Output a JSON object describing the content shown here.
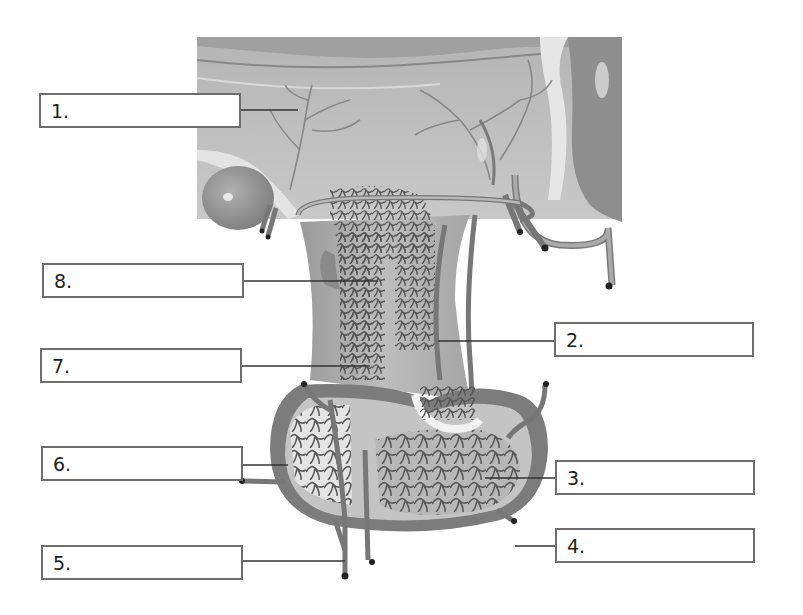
{
  "diagram": {
    "colors": {
      "background": "#ffffff",
      "tissue_light": "#c9c9c9",
      "tissue_mid": "#a9a9a9",
      "tissue_dark": "#7d7d7d",
      "vessel": "#8a8a8a",
      "vessel_outline": "#4a4a4a",
      "label_border": "#6e6e6e",
      "leader_line": "#333333"
    },
    "labels": [
      {
        "id": 1,
        "text": "1.",
        "side": "left"
      },
      {
        "id": 2,
        "text": "2.",
        "side": "right"
      },
      {
        "id": 3,
        "text": "3.",
        "side": "right"
      },
      {
        "id": 4,
        "text": "4.",
        "side": "right"
      },
      {
        "id": 5,
        "text": "5.",
        "side": "left"
      },
      {
        "id": 6,
        "text": "6.",
        "side": "left"
      },
      {
        "id": 7,
        "text": "7.",
        "side": "left"
      },
      {
        "id": 8,
        "text": "8.",
        "side": "left"
      }
    ]
  }
}
